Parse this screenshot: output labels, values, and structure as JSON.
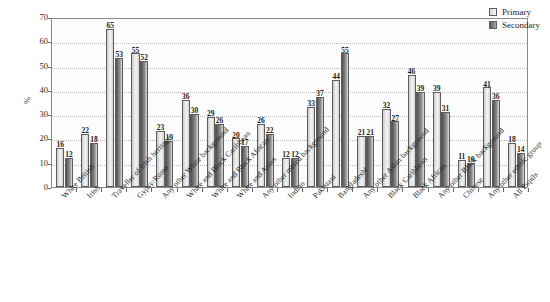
{
  "chart_data": {
    "type": "bar",
    "title": "",
    "subtitle": "",
    "xlabel": "",
    "ylabel": "%",
    "ylim": [
      0,
      70
    ],
    "y_ticks": [
      0,
      10,
      20,
      30,
      40,
      50,
      60,
      70
    ],
    "grid": true,
    "legend_position": "top-right",
    "categories": [
      "White British",
      "Irish",
      "Traveller of Irish heritage",
      "Gypsy/Roma",
      "Any other White background",
      "White and Black Caribbean",
      "White and Black African",
      "White and Asian",
      "Any other mixed background",
      "Indian",
      "Pakistani",
      "Bangladeshi",
      "Any other Asian background",
      "Black Caribbean",
      "Black African",
      "Any other Black background",
      "Chinese",
      "Any other ethnic group",
      "All Pupils"
    ],
    "series": [
      {
        "name": "Primary",
        "color": "#e8e8e8",
        "values": [
          16,
          22,
          65,
          55,
          23,
          36,
          29,
          20,
          26,
          12,
          33,
          44,
          21,
          32,
          46,
          39,
          11,
          41,
          18
        ]
      },
      {
        "name": "Secondary",
        "color": "#6f6f6f",
        "values": [
          12,
          18,
          53,
          52,
          19,
          30,
          26,
          17,
          22,
          12,
          37,
          55,
          21,
          27,
          39,
          31,
          10,
          36,
          14
        ]
      }
    ]
  },
  "legend": {
    "items": [
      {
        "label": "Primary",
        "swatch": "primary"
      },
      {
        "label": "Secondary",
        "swatch": "secondary"
      }
    ]
  }
}
